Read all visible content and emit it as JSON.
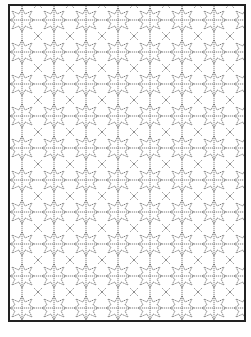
{
  "figure": {
    "tile_size": 32,
    "line_color": "#555555",
    "border_color": "#222222"
  }
}
